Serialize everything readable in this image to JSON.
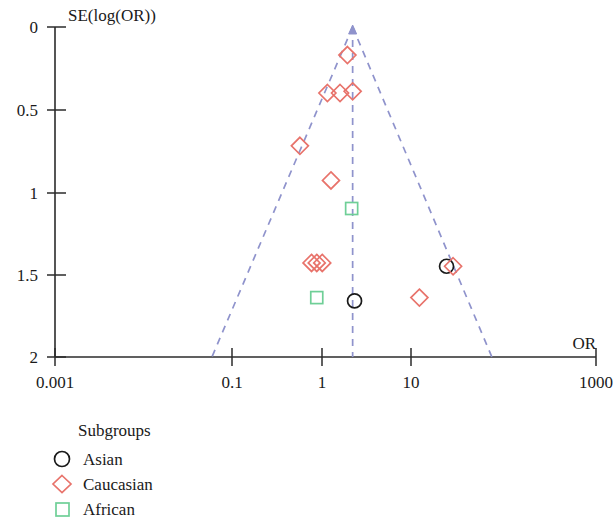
{
  "chart_data": {
    "type": "scatter",
    "title": "",
    "subtitle": "",
    "xlabel": "OR",
    "ylabel": "SE(log(OR))",
    "x_scale": "log",
    "xlim": [
      0.001,
      1000
    ],
    "ylim": [
      0,
      2
    ],
    "y_inverted": true,
    "grid": false,
    "x_ticks": [
      "0.001",
      "0.1",
      "1",
      "10",
      "1000"
    ],
    "x_tick_values": [
      0.001,
      0.1,
      1,
      10,
      1000
    ],
    "y_ticks": [
      "0",
      "0.5",
      "1",
      "1.5",
      "2"
    ],
    "y_tick_values": [
      0,
      0.5,
      1,
      1.5,
      2
    ],
    "legend_title": "Subgroups",
    "legend_position": "below-left",
    "series": [
      {
        "name": "Asian",
        "marker": "circle",
        "color": "#1a1a1a",
        "points": [
          {
            "or": 22.0,
            "se": 1.45
          },
          {
            "or": 2.1,
            "se": 1.66
          }
        ]
      },
      {
        "name": "Caucasian",
        "marker": "diamond",
        "color": "#e8736b",
        "points": [
          {
            "or": 1.75,
            "se": 0.17
          },
          {
            "or": 1.05,
            "se": 0.4
          },
          {
            "or": 1.45,
            "se": 0.4
          },
          {
            "or": 2.0,
            "se": 0.39
          },
          {
            "or": 0.52,
            "se": 0.72
          },
          {
            "or": 1.15,
            "se": 0.93
          },
          {
            "or": 0.7,
            "se": 1.43
          },
          {
            "or": 0.8,
            "se": 1.43
          },
          {
            "or": 0.92,
            "se": 1.43
          },
          {
            "or": 26.0,
            "se": 1.45
          },
          {
            "or": 11.0,
            "se": 1.64
          }
        ]
      },
      {
        "name": "African",
        "marker": "square",
        "color": "#6fcf97",
        "points": [
          {
            "or": 1.95,
            "se": 1.1
          },
          {
            "or": 0.8,
            "se": 1.64
          }
        ]
      }
    ],
    "funnel": {
      "apex": {
        "or": 2.0,
        "se": 0.0
      },
      "left_base": {
        "or": 0.055,
        "se": 2.0
      },
      "right_base": {
        "or": 70.0,
        "se": 2.0
      },
      "center_line_or": 2.0,
      "color": "#8f93cc",
      "style": "dashed"
    }
  },
  "axes": {
    "y_title": "SE(log(OR))",
    "x_title": "OR"
  },
  "legend": {
    "title": "Subgroups",
    "items": [
      {
        "label": "Asian",
        "icon": "circle-marker-icon",
        "color": "#1a1a1a"
      },
      {
        "label": "Caucasian",
        "icon": "diamond-marker-icon",
        "color": "#e8736b"
      },
      {
        "label": "African",
        "icon": "square-marker-icon",
        "color": "#6fcf97"
      }
    ]
  }
}
